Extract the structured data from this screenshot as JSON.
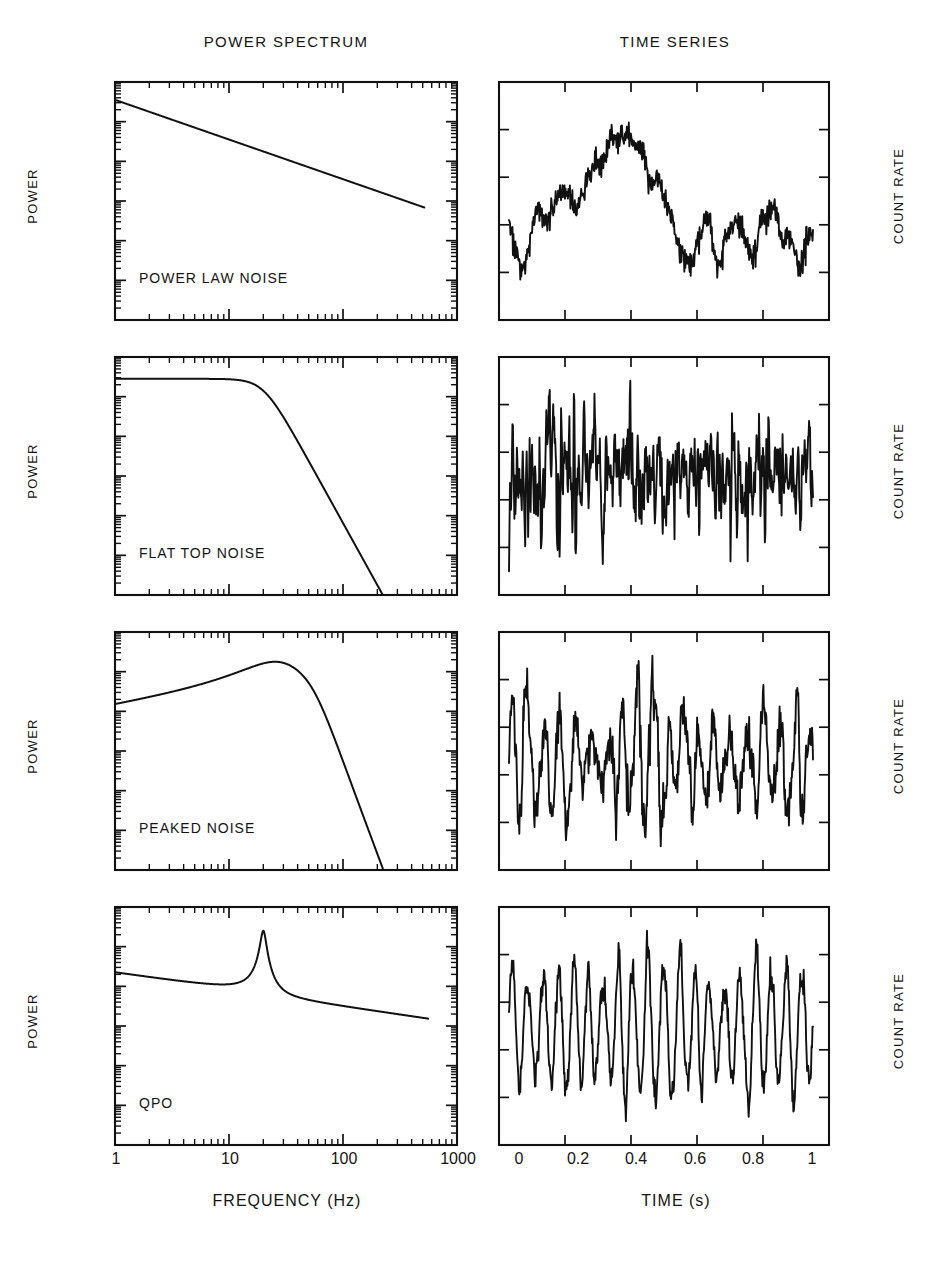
{
  "figure": {
    "column_headers": [
      {
        "id": "power-spectrum",
        "label": "POWER SPECTRUM"
      },
      {
        "id": "time-series",
        "label": "TIME SERIES"
      }
    ],
    "left_axis_label": "POWER",
    "right_axis_label": "COUNT RATE",
    "xlabel_left": "FREQUENCY (Hz)",
    "xlabel_right": "TIME (s)",
    "freq_ticks": [
      "1",
      "10",
      "100",
      "1000"
    ],
    "time_ticks": [
      "0",
      "0.2",
      "0.4",
      "0.6",
      "0.8",
      "1"
    ],
    "row_labels": [
      "POWER LAW NOISE",
      "FLAT TOP NOISE",
      "PEAKED NOISE",
      "QPO"
    ],
    "ink_color": "#111111",
    "background_color": "#ffffff"
  },
  "chart_data": [
    {
      "type": "line",
      "panel": "power-spectrum-row-1",
      "title": "POWER LAW NOISE",
      "xlabel": "FREQUENCY (Hz)",
      "ylabel": "POWER",
      "xscale": "log",
      "yscale": "log",
      "xlim": [
        1,
        1000
      ],
      "xticks": [
        1,
        10,
        100,
        1000
      ],
      "grid": false,
      "model": "power law, P(f) proportional to f^-1",
      "x": [
        1,
        2,
        5,
        10,
        20,
        50,
        100,
        200,
        500
      ],
      "y": [
        1.0,
        0.5,
        0.2,
        0.1,
        0.05,
        0.02,
        0.01,
        0.005,
        0.002
      ],
      "note": "Straight descending line on log-log axes from f=1 to f=500"
    },
    {
      "type": "line",
      "panel": "time-series-row-1",
      "title": "POWER LAW NOISE",
      "xlabel": "TIME (s)",
      "ylabel": "COUNT RATE",
      "xlim": [
        0,
        1
      ],
      "xticks": [
        0,
        0.2,
        0.4,
        0.6,
        0.8,
        1
      ],
      "grid": false,
      "note": "Red-noise random walk: slow large-amplitude wandering with fine high-frequency jitter"
    },
    {
      "type": "line",
      "panel": "power-spectrum-row-2",
      "title": "FLAT TOP NOISE",
      "xlabel": "FREQUENCY (Hz)",
      "ylabel": "POWER",
      "xscale": "log",
      "yscale": "log",
      "xlim": [
        1,
        1000
      ],
      "xticks": [
        1,
        10,
        100,
        1000
      ],
      "grid": false,
      "model": "zero-centred Lorentzian, flat below break then steep cutoff",
      "break_frequency_hz": 20,
      "x": [
        1,
        3,
        10,
        20,
        40,
        80,
        150,
        300,
        500
      ],
      "y": [
        1.0,
        0.99,
        0.9,
        0.7,
        0.3,
        0.08,
        0.015,
        0.002,
        0.0004
      ],
      "note": "Flat top out to about 20 Hz then rapid roll-off reaching bottom near 500 Hz"
    },
    {
      "type": "line",
      "panel": "time-series-row-2",
      "title": "FLAT TOP NOISE",
      "xlabel": "TIME (s)",
      "ylabel": "COUNT RATE",
      "xlim": [
        0,
        1
      ],
      "xticks": [
        0,
        0.2,
        0.4,
        0.6,
        0.8,
        1
      ],
      "grid": false,
      "note": "Band-limited white noise: rapid erratic fluctuations, no preferred period"
    },
    {
      "type": "line",
      "panel": "power-spectrum-row-3",
      "title": "PEAKED NOISE",
      "xlabel": "FREQUENCY (Hz)",
      "ylabel": "POWER",
      "xscale": "log",
      "yscale": "log",
      "xlim": [
        1,
        1000
      ],
      "xticks": [
        1,
        10,
        100,
        1000
      ],
      "grid": false,
      "model": "broad Lorentzian peak, quality factor near 1",
      "peak_frequency_hz": 22,
      "x": [
        1,
        3,
        8,
        15,
        22,
        40,
        80,
        150,
        220
      ],
      "y": [
        0.18,
        0.42,
        0.8,
        0.97,
        1.0,
        0.6,
        0.14,
        0.01,
        0.001
      ],
      "note": "Broad hump peaking near 22 Hz then falling steeply to the axis near 200 Hz"
    },
    {
      "type": "line",
      "panel": "time-series-row-3",
      "title": "PEAKED NOISE",
      "xlabel": "TIME (s)",
      "ylabel": "COUNT RATE",
      "xlim": [
        0,
        1
      ],
      "xticks": [
        0,
        0.2,
        0.4,
        0.6,
        0.8,
        1
      ],
      "grid": false,
      "note": "Quasi-periodic wiggles of roughly 20 Hz with strongly varying amplitude and phase"
    },
    {
      "type": "line",
      "panel": "power-spectrum-row-4",
      "title": "QPO",
      "xlabel": "FREQUENCY (Hz)",
      "ylabel": "POWER",
      "xscale": "log",
      "yscale": "log",
      "xlim": [
        1,
        1000
      ],
      "xticks": [
        1,
        10,
        100,
        1000
      ],
      "grid": false,
      "model": "narrow Lorentzian QPO on a power law continuum",
      "peak_frequency_hz": 20,
      "x": [
        1,
        5,
        12,
        18,
        20,
        25,
        50,
        150,
        500
      ],
      "y": [
        0.2,
        0.24,
        0.36,
        0.7,
        1.0,
        0.5,
        0.16,
        0.05,
        0.012
      ],
      "note": "Sharp narrow peak at about 20 Hz sitting on a gently rising then falling continuum"
    },
    {
      "type": "line",
      "panel": "time-series-row-4",
      "title": "QPO",
      "xlabel": "TIME (s)",
      "ylabel": "COUNT RATE",
      "xlim": [
        0,
        1
      ],
      "xticks": [
        0,
        0.2,
        0.4,
        0.6,
        0.8,
        1
      ],
      "grid": false,
      "note": "Nearly coherent 20 Hz oscillation with slowly drifting amplitude and phase"
    }
  ]
}
